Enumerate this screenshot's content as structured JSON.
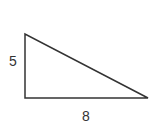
{
  "diagram": {
    "type": "right-triangle",
    "stroke_color": "#333333",
    "fill_color": "#ffffff",
    "vertices": {
      "top": [
        25,
        34
      ],
      "bottom_left": [
        25,
        98
      ],
      "bottom_right": [
        148,
        98
      ]
    },
    "labels": {
      "height": "5",
      "base": "8"
    }
  }
}
